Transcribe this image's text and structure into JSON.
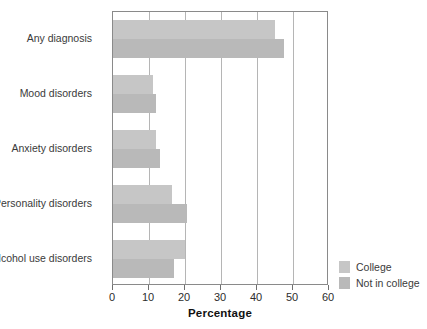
{
  "chart_data": {
    "type": "bar",
    "orientation": "horizontal",
    "title": "",
    "xlabel": "Percentage",
    "ylabel": "",
    "xlim": [
      0,
      60
    ],
    "xticks": [
      0,
      10,
      20,
      30,
      40,
      50,
      60
    ],
    "xtick_labels": [
      "0",
      "10",
      "20",
      "30",
      "40",
      "50",
      "60"
    ],
    "grid": "vertical",
    "legend_position": "bottom-right-outside",
    "categories": [
      "Any diagnosis",
      "Mood disorders",
      "Anxiety disorders",
      "Personality disorders",
      "Alcohol use disorders"
    ],
    "series": [
      {
        "name": "College",
        "color": "#c6c6c6",
        "values": [
          45.0,
          11.0,
          12.0,
          16.5,
          20.0
        ]
      },
      {
        "name": "Not in college",
        "color": "#b9b9b9",
        "values": [
          47.5,
          12.0,
          13.0,
          20.5,
          17.0
        ]
      }
    ]
  },
  "axis": {
    "x_title": "Percentage"
  },
  "legend": {
    "items": [
      {
        "label": "College",
        "color": "#c6c6c6"
      },
      {
        "label": "Not in college",
        "color": "#b9b9b9"
      }
    ]
  }
}
